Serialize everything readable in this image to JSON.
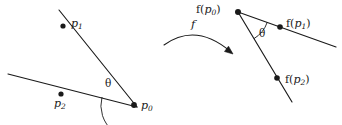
{
  "figure": {
    "kind": "geometry-diagram",
    "width": 342,
    "height": 125,
    "background": "#ffffff",
    "ink": "#1a1a1a"
  },
  "labels": {
    "p1": {
      "base": "p",
      "sub": "1"
    },
    "p2": {
      "base": "p",
      "sub": "2"
    },
    "p0": {
      "base": "p",
      "sub": "0"
    },
    "fp0": {
      "prefix": "f(",
      "base": "p",
      "sub": "0",
      "suffix": ")"
    },
    "fp1": {
      "prefix": "f(",
      "base": "p",
      "sub": "1",
      "suffix": ")"
    },
    "fp2": {
      "prefix": "f(",
      "base": "p",
      "sub": "2",
      "suffix": ")"
    },
    "f": "f",
    "theta_left": "θ",
    "theta_right": "θ"
  },
  "geometry": {
    "left": {
      "vertex": {
        "name": "p0",
        "x": 134,
        "y": 105
      },
      "line_p1": {
        "x1": 59,
        "y1": 10,
        "x2": 137,
        "y2": 107,
        "point": {
          "x": 63,
          "y": 26
        }
      },
      "line_p2": {
        "x1": 8,
        "y1": 74,
        "x2": 137,
        "y2": 107,
        "point": {
          "x": 61,
          "y": 94
        }
      },
      "angle_arc": {
        "cx": 134,
        "cy": 105,
        "r": 33,
        "start_deg": 194,
        "end_deg": 232
      }
    },
    "arrow": {
      "from": {
        "x": 164,
        "y": 45
      },
      "to": {
        "x": 233,
        "y": 54
      },
      "control": {
        "x": 196,
        "y": 22
      }
    },
    "right": {
      "vertex": {
        "name": "fp0",
        "x": 238,
        "y": 12
      },
      "line_fp1": {
        "x1": 238,
        "y1": 12,
        "x2": 336,
        "y2": 47,
        "point": {
          "x": 280,
          "y": 27
        }
      },
      "line_fp2": {
        "x1": 238,
        "y1": 12,
        "x2": 292,
        "y2": 102,
        "point": {
          "x": 277,
          "y": 78
        }
      },
      "angle_arc": {
        "cx": 238,
        "cy": 12,
        "r": 31,
        "start_deg": 19,
        "end_deg": 59
      }
    }
  }
}
